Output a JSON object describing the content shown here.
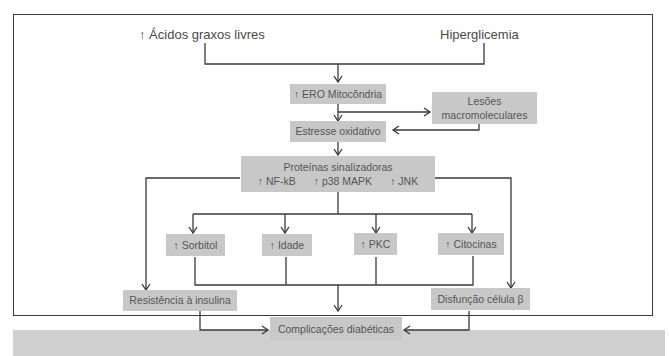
{
  "diagram": {
    "inputs": {
      "left": "↑ Ácidos graxos livres",
      "right": "Hiperglicemia"
    },
    "nodes": {
      "ero": "↑ ERO Mitocôndria",
      "lesoes_line1": "Lesões",
      "lesoes_line2": "macromoleculares",
      "estresse": "Estresse oxidativo",
      "proteinas_title": "Proteínas sinalizadoras",
      "proteinas_items": [
        "↑ NF-kB",
        "↑ p38 MAPK",
        "↑ JNK"
      ],
      "sorbitol": "↑ Sorbitol",
      "idade": "↑ Idade",
      "pkc": "↑ PKC",
      "citocinas": "↑ Citocinas",
      "resistencia": "Resistência à insulina",
      "disfuncao": "Disfunção célula β",
      "complicacoes": "Complicações diabéticas"
    },
    "colors": {
      "box_fill": "#c8c8c8",
      "line": "#3a3a3a",
      "text": "#555555"
    }
  }
}
